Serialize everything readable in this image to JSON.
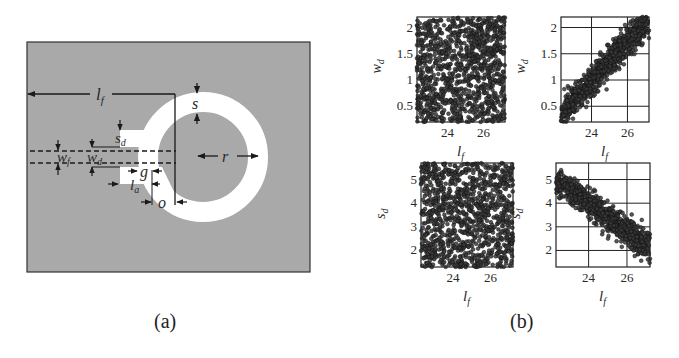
{
  "panel_a": {
    "caption": "(a)",
    "colors": {
      "substrate": "#a9a9a9",
      "metal": "#ffffff",
      "line": "#1a1a1a"
    },
    "labels": {
      "lf": "l",
      "lf_sub": "f",
      "s": "s",
      "sd": "s",
      "sd_sub": "d",
      "wf": "w",
      "wf_sub": "f",
      "wd": "w",
      "wd_sub": "d",
      "g": "g",
      "la": "l",
      "la_sub": "a",
      "o": "o",
      "r": "r"
    }
  },
  "panel_b": {
    "caption": "(b)"
  },
  "chart_data": [
    {
      "type": "scatter",
      "position": "top-left",
      "xlabel": "l_f",
      "ylabel": "w_d",
      "xticks": [
        24,
        26
      ],
      "yticks": [
        0.5,
        1,
        1.5,
        2
      ],
      "xlim": [
        22.3,
        27.2
      ],
      "ylim": [
        0.2,
        2.2
      ],
      "grid": false,
      "description": "uniform random scatter filling entire region (uncorrelated)"
    },
    {
      "type": "scatter",
      "position": "top-right",
      "xlabel": "l_f",
      "ylabel": "w_d",
      "xticks": [
        24,
        26
      ],
      "yticks": [
        0.5,
        1,
        1.5,
        2
      ],
      "xlim": [
        22.3,
        27.2
      ],
      "ylim": [
        0.2,
        2.2
      ],
      "grid": true,
      "description": "positively correlated band from (22.3,0.3) to (27.2,2.2)",
      "trend": {
        "x": [
          22.3,
          27.2
        ],
        "y": [
          0.35,
          2.15
        ],
        "band_halfwidth": 0.25
      }
    },
    {
      "type": "scatter",
      "position": "bottom-left",
      "xlabel": "l_f",
      "ylabel": "s_d",
      "xticks": [
        24,
        26
      ],
      "yticks": [
        2,
        3,
        4,
        5
      ],
      "xlim": [
        22.3,
        27.2
      ],
      "ylim": [
        1.3,
        5.7
      ],
      "grid": false,
      "description": "uniform random scatter filling entire region (uncorrelated)"
    },
    {
      "type": "scatter",
      "position": "bottom-right",
      "xlabel": "l_f",
      "ylabel": "s_d",
      "xticks": [
        24,
        26
      ],
      "yticks": [
        2,
        3,
        4,
        5
      ],
      "xlim": [
        22.3,
        27.2
      ],
      "ylim": [
        1.3,
        5.7
      ],
      "grid": true,
      "description": "negatively correlated band from (22.3,5.1) to (27.2,1.9)",
      "trend": {
        "x": [
          22.3,
          27.2
        ],
        "y": [
          5.0,
          2.1
        ],
        "band_halfwidth": 0.5
      }
    }
  ]
}
